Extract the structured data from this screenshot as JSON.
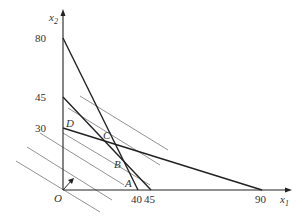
{
  "diagram": {
    "type": "linear-programming-feasible-region",
    "axes": {
      "x_label": "x",
      "x_sub": "1",
      "y_label": "x",
      "y_sub": "2",
      "origin_label": "O"
    },
    "x_ticks": [
      "40",
      "45",
      "90"
    ],
    "y_ticks": [
      "80",
      "45",
      "30"
    ],
    "points": [
      "A",
      "B",
      "C",
      "D"
    ],
    "constraint_lines": [
      {
        "from": "(0,80)",
        "to": "(40,0)"
      },
      {
        "from": "(0,45)",
        "to": "(45,0)"
      },
      {
        "from": "(0,30)",
        "to": "(90,0)"
      }
    ],
    "objective_lines_count": 6,
    "gradient_arrow": "from O toward upper-right"
  }
}
